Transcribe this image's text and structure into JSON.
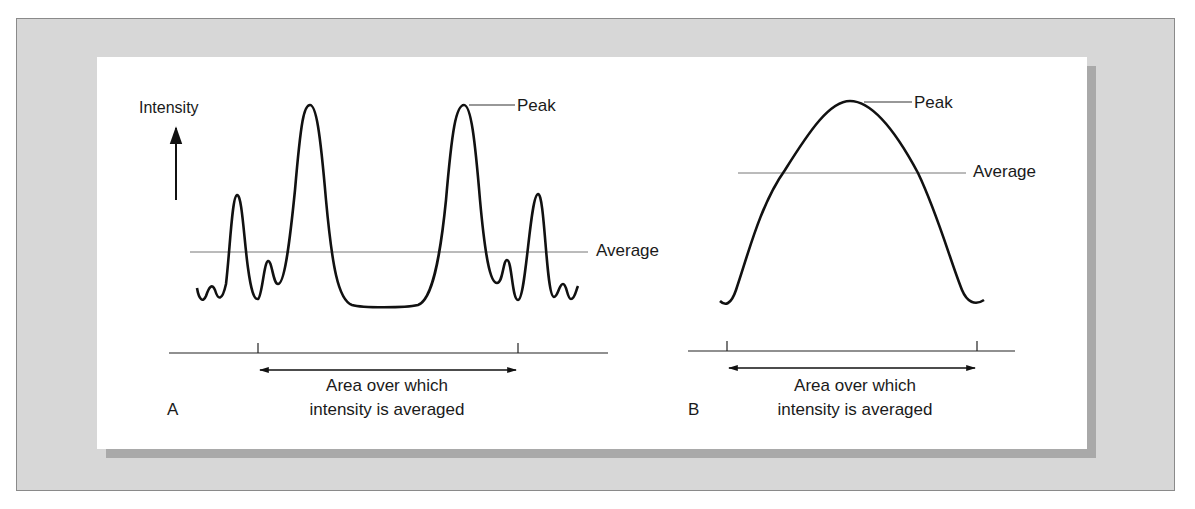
{
  "figure": {
    "panel_a": {
      "letter": "A",
      "y_axis_label": "Intensity",
      "peak_label": "Peak",
      "average_label": "Average",
      "area_label_line1": "Area over which",
      "area_label_line2": "intensity is averaged",
      "description": "Narrow spiky beam profile: multiple side lobes and two tall narrow peaks; average far below peak"
    },
    "panel_b": {
      "letter": "B",
      "peak_label": "Peak",
      "average_label": "Average",
      "area_label_line1": "Area over which",
      "area_label_line2": "intensity is averaged",
      "description": "Smooth broad bell-shaped profile; average closer to peak"
    },
    "colors": {
      "frame": "#d7d7d7",
      "shadow": "#a9a9a9",
      "card": "#ffffff",
      "line": "#111111",
      "average_line": "#777777"
    }
  }
}
